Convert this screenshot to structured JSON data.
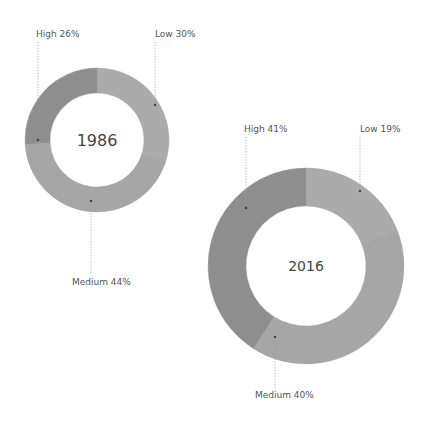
{
  "chart_data": [
    {
      "type": "pie",
      "variant": "donut",
      "title": "1986",
      "categories": [
        "Low",
        "Medium",
        "High"
      ],
      "values": [
        30,
        44,
        26
      ],
      "unit": "%",
      "labels": [
        "Low 30%",
        "Medium 44%",
        "High 26%"
      ],
      "colors": [
        "#ababab",
        "#a6a6a6",
        "#8e8e8e"
      ],
      "start_angle": "12 o'clock, clockwise",
      "legend": "none (callout labels with dotted leader lines)"
    },
    {
      "type": "pie",
      "variant": "donut",
      "title": "2016",
      "categories": [
        "Low",
        "Medium",
        "High"
      ],
      "values": [
        19,
        40,
        41
      ],
      "unit": "%",
      "labels": [
        "Low 19%",
        "Medium 40%",
        "High 41%"
      ],
      "colors": [
        "#ababab",
        "#a6a6a6",
        "#8e8e8e"
      ],
      "start_angle": "12 o'clock, clockwise",
      "legend": "none (callout labels with dotted leader lines)"
    }
  ],
  "layout": [
    {
      "cx": 97,
      "cy": 140,
      "r_outer": 72,
      "r_inner": 47,
      "year_font": 16,
      "callouts": [
        {
          "text_x": 155,
          "text_y": 37,
          "line_x": 155,
          "line_y1": 42,
          "dot_x": 155,
          "dot_y": 105,
          "anchor": "start"
        },
        {
          "text_x": 72,
          "text_y": 285,
          "line_x": 91,
          "line_y1": 273,
          "dot_x": 91,
          "dot_y": 201,
          "anchor": "start"
        },
        {
          "text_x": 36,
          "text_y": 37,
          "line_x": 38,
          "line_y1": 42,
          "dot_x": 38,
          "dot_y": 140,
          "anchor": "start"
        }
      ]
    },
    {
      "cx": 306,
      "cy": 266,
      "r_outer": 98,
      "r_inner": 60,
      "year_font": 14,
      "callouts": [
        {
          "text_x": 360,
          "text_y": 132,
          "line_x": 360,
          "line_y1": 137,
          "dot_x": 360,
          "dot_y": 191,
          "anchor": "start"
        },
        {
          "text_x": 255,
          "text_y": 398,
          "line_x": 275,
          "line_y1": 388,
          "dot_x": 275,
          "dot_y": 337,
          "anchor": "start"
        },
        {
          "text_x": 244,
          "text_y": 132,
          "line_x": 246,
          "line_y1": 137,
          "dot_x": 246,
          "dot_y": 208,
          "anchor": "start"
        }
      ]
    }
  ]
}
